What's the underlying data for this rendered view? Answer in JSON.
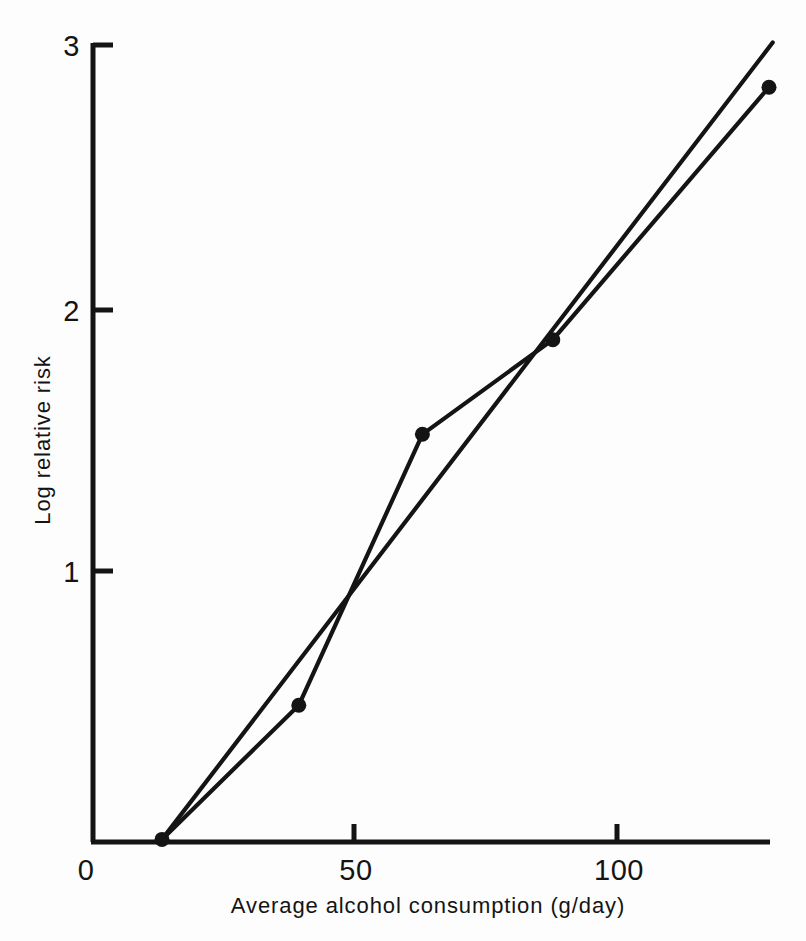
{
  "chart_data": {
    "type": "line",
    "title": "",
    "xlabel": "Average alcohol consumption (g/day)",
    "ylabel": "Log relative risk",
    "xlim": [
      0,
      129
    ],
    "ylim": [
      0,
      3
    ],
    "grid": false,
    "legend": "none",
    "x_ticks": [
      {
        "value": 0,
        "label": "0"
      },
      {
        "value": 50,
        "label": "50"
      },
      {
        "value": 100,
        "label": "100"
      }
    ],
    "y_ticks": [
      {
        "value": 0,
        "label": "0"
      },
      {
        "value": 1,
        "label": "1"
      },
      {
        "value": 2,
        "label": "2"
      },
      {
        "value": 3,
        "label": "3"
      }
    ],
    "series": [
      {
        "name": "observed",
        "type": "line-with-markers",
        "x": [
          13.5,
          39.5,
          63.0,
          87.8,
          128.9
        ],
        "y": [
          0.01,
          0.52,
          1.55,
          1.91,
          2.87
        ],
        "markers": true
      },
      {
        "name": "fitted",
        "type": "line",
        "x": [
          13.5,
          129.6
        ],
        "y": [
          0.01,
          3.04
        ],
        "markers": false
      }
    ],
    "data_points": [
      {
        "x": 13.5,
        "y": 0.01
      },
      {
        "x": 39.5,
        "y": 0.52
      },
      {
        "x": 63.0,
        "y": 1.55
      },
      {
        "x": 87.8,
        "y": 1.91
      },
      {
        "x": 128.9,
        "y": 2.87
      }
    ]
  },
  "axes": {
    "x_title": "Average alcohol consumption (g/day)",
    "y_title": "Log relative risk",
    "x_tick_labels": [
      "0",
      "50",
      "100"
    ],
    "y_tick_labels": [
      "0",
      "1",
      "2",
      "3"
    ]
  }
}
